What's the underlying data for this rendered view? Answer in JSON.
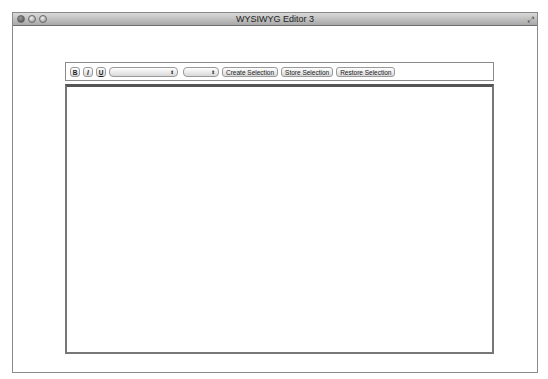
{
  "window": {
    "title": "WYSIWYG Editor 3",
    "controls": [
      "close",
      "minimize",
      "zoom"
    ]
  },
  "toolbar": {
    "bold_label": "B",
    "italic_label": "I",
    "underline_label": "U",
    "font_select": {
      "value": ""
    },
    "size_select": {
      "value": ""
    },
    "create_selection_label": "Create Selection",
    "store_selection_label": "Store Selection",
    "restore_selection_label": "Restore Selection"
  },
  "editor": {
    "content": ""
  }
}
